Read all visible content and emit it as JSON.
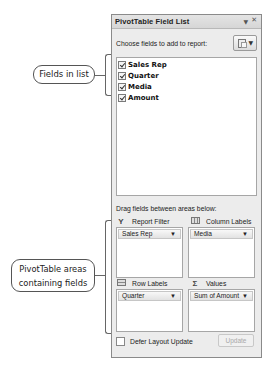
{
  "panel": {
    "title": "PivotTable Field List",
    "title_dropdown_icon": "▼",
    "close_icon": "✕",
    "choose_label": "Choose fields to add to report:",
    "layout_button_arrow": "▼",
    "fields": [
      {
        "label": "Sales Rep",
        "checked": true
      },
      {
        "label": "Quarter",
        "checked": true
      },
      {
        "label": "Media",
        "checked": true
      },
      {
        "label": "Amount",
        "checked": true
      }
    ],
    "drag_label": "Drag fields between areas below:",
    "areas": {
      "report_filter": {
        "label": "Report Filter",
        "icon": "filter-icon",
        "glyph": "⊻",
        "field": "Sales Rep"
      },
      "column_labels": {
        "label": "Column Labels",
        "icon": "columns-icon",
        "field": "Media"
      },
      "row_labels": {
        "label": "Row Labels",
        "icon": "rows-icon",
        "field": "Quarter"
      },
      "values": {
        "label": "Values",
        "icon": "sigma-icon",
        "glyph": "Σ",
        "field": "Sum of Amount"
      }
    },
    "pill_dropdown": "▼",
    "defer_label": "Defer Layout Update",
    "defer_checked": false,
    "update_label": "Update"
  },
  "callouts": {
    "fields_in_list": "Fields in list",
    "areas_line1": "PivotTable areas",
    "areas_line2": "containing fields"
  }
}
